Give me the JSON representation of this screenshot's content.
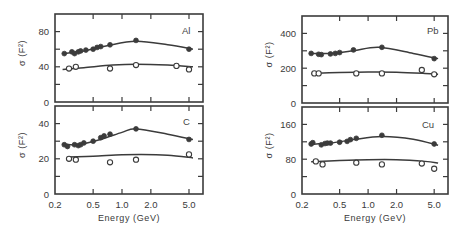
{
  "chart_data": [
    {
      "type": "scatter",
      "panel": "Al",
      "title": "Al",
      "xlabel": "Energy (GeV)",
      "ylabel": "σ (F²)",
      "xscale": "log",
      "xlim": [
        0.2,
        7.0
      ],
      "xticks": [
        0.2,
        0.5,
        1.0,
        2.0,
        5.0
      ],
      "xtick_labels": [
        "0.2",
        "0.5",
        "1.0",
        "2.0",
        "5.0"
      ],
      "ylim": [
        0,
        100
      ],
      "yticks": [
        0,
        40,
        80
      ],
      "yticks_minor": [
        20,
        60
      ],
      "series": [
        {
          "name": "filled",
          "marker": "filled-circle",
          "x": [
            0.25,
            0.3,
            0.32,
            0.35,
            0.37,
            0.42,
            0.5,
            0.55,
            0.6,
            0.75,
            1.4,
            5.0
          ],
          "y": [
            55,
            57,
            55,
            57,
            58,
            59,
            60,
            62,
            63,
            65,
            70,
            60
          ]
        },
        {
          "name": "open",
          "marker": "open-circle",
          "x": [
            0.28,
            0.33,
            0.75,
            1.4,
            3.7,
            5.0
          ],
          "y": [
            38,
            40,
            38,
            42,
            41,
            37
          ]
        }
      ],
      "fit_curves": [
        {
          "name": "filled-fit",
          "x": [
            0.24,
            0.4,
            0.7,
            1.4,
            3.0,
            5.5
          ],
          "y": [
            55,
            58,
            64,
            69,
            65,
            60
          ]
        },
        {
          "name": "open-fit",
          "x": [
            0.24,
            0.4,
            0.8,
            1.4,
            3.0,
            5.5
          ],
          "y": [
            37,
            39,
            42,
            43,
            42,
            40
          ]
        }
      ]
    },
    {
      "type": "scatter",
      "panel": "C",
      "title": "C",
      "xlabel": "Energy (GeV)",
      "ylabel": "σ (F²)",
      "xscale": "log",
      "xlim": [
        0.2,
        7.0
      ],
      "xticks": [
        0.2,
        0.5,
        1.0,
        2.0,
        5.0
      ],
      "xtick_labels": [
        "0.2",
        "0.5",
        "1.0",
        "2.0",
        "5.0"
      ],
      "ylim": [
        0,
        50
      ],
      "yticks": [
        0,
        20,
        40
      ],
      "yticks_minor": [
        10,
        30
      ],
      "series": [
        {
          "name": "filled",
          "marker": "filled-circle",
          "x": [
            0.25,
            0.27,
            0.32,
            0.35,
            0.37,
            0.4,
            0.5,
            0.6,
            0.65,
            0.75,
            1.4,
            5.0
          ],
          "y": [
            28,
            27,
            28,
            27.5,
            28,
            29,
            30,
            32,
            33,
            34,
            37,
            31
          ]
        },
        {
          "name": "open",
          "marker": "open-circle",
          "x": [
            0.28,
            0.33,
            0.75,
            1.4,
            5.0
          ],
          "y": [
            20,
            19.5,
            18,
            19.5,
            22.5
          ]
        }
      ],
      "fit_curves": [
        {
          "name": "filled-fit",
          "x": [
            0.24,
            0.35,
            0.6,
            1.0,
            1.4,
            3.0,
            5.5
          ],
          "y": [
            28.5,
            28,
            31,
            35,
            37,
            34,
            31
          ]
        },
        {
          "name": "open-fit",
          "x": [
            0.28,
            0.5,
            1.0,
            1.6,
            3.0,
            5.5
          ],
          "y": [
            21,
            21.5,
            22.3,
            22.5,
            22,
            20.5
          ]
        }
      ]
    },
    {
      "type": "scatter",
      "panel": "Pb",
      "title": "Pb",
      "xlabel": "Energy (GeV)",
      "ylabel": "σ (F²)",
      "xscale": "log",
      "xlim": [
        0.2,
        7.0
      ],
      "xticks": [
        0.2,
        0.5,
        1.0,
        2.0,
        5.0
      ],
      "xtick_labels": [
        "0.2",
        "0.5",
        "1.0",
        "2.0",
        "5.0"
      ],
      "ylim": [
        0,
        500
      ],
      "yticks": [
        0,
        200,
        400
      ],
      "yticks_minor": [
        100,
        300
      ],
      "series": [
        {
          "name": "filled",
          "marker": "filled-circle",
          "x": [
            0.25,
            0.3,
            0.32,
            0.4,
            0.45,
            0.5,
            0.7,
            1.4,
            5.0
          ],
          "y": [
            285,
            280,
            278,
            282,
            285,
            290,
            305,
            320,
            255
          ]
        },
        {
          "name": "open",
          "marker": "open-circle",
          "x": [
            0.27,
            0.3,
            0.75,
            1.4,
            3.7,
            5.0
          ],
          "y": [
            170,
            170,
            170,
            170,
            190,
            165
          ]
        }
      ],
      "fit_curves": [
        {
          "name": "filled-fit",
          "x": [
            0.24,
            0.4,
            0.7,
            1.3,
            3.0,
            5.5
          ],
          "y": [
            285,
            285,
            300,
            320,
            285,
            255
          ]
        },
        {
          "name": "open-fit",
          "x": [
            0.25,
            0.5,
            1.0,
            2.0,
            4.0,
            5.5
          ],
          "y": [
            170,
            175,
            178,
            177,
            170,
            165
          ]
        }
      ]
    },
    {
      "type": "scatter",
      "panel": "Cu",
      "title": "Cu",
      "xlabel": "Energy (GeV)",
      "ylabel": "σ (F²)",
      "xscale": "log",
      "xlim": [
        0.2,
        7.0
      ],
      "xticks": [
        0.2,
        0.5,
        1.0,
        2.0,
        5.0
      ],
      "xtick_labels": [
        "0.2",
        "0.5",
        "1.0",
        "2.0",
        "5.0"
      ],
      "ylim": [
        0,
        200
      ],
      "yticks": [
        0,
        80,
        160
      ],
      "yticks_minor": [
        40,
        120
      ],
      "series": [
        {
          "name": "filled",
          "marker": "filled-circle",
          "x": [
            0.25,
            0.26,
            0.32,
            0.35,
            0.37,
            0.4,
            0.5,
            0.6,
            0.65,
            0.75,
            1.4,
            5.0
          ],
          "y": [
            115,
            118,
            113,
            116,
            117,
            117,
            119,
            121,
            125,
            128,
            135,
            115
          ]
        },
        {
          "name": "open",
          "marker": "open-circle",
          "x": [
            0.28,
            0.33,
            0.75,
            1.4,
            3.7,
            5.0
          ],
          "y": [
            75,
            68,
            72,
            68,
            70,
            58
          ]
        }
      ],
      "fit_curves": [
        {
          "name": "filled-fit",
          "x": [
            0.24,
            0.4,
            0.7,
            1.4,
            3.0,
            5.5
          ],
          "y": [
            114,
            117,
            125,
            132,
            126,
            112
          ]
        },
        {
          "name": "open-fit",
          "x": [
            0.25,
            0.5,
            1.0,
            2.0,
            4.0,
            5.5
          ],
          "y": [
            74,
            77,
            79,
            79,
            75,
            71
          ]
        }
      ]
    }
  ],
  "axis_text": {
    "xlabel": "Energy (GeV)",
    "ylabel_sigma": "σ",
    "ylabel_unit": "(F²)"
  }
}
